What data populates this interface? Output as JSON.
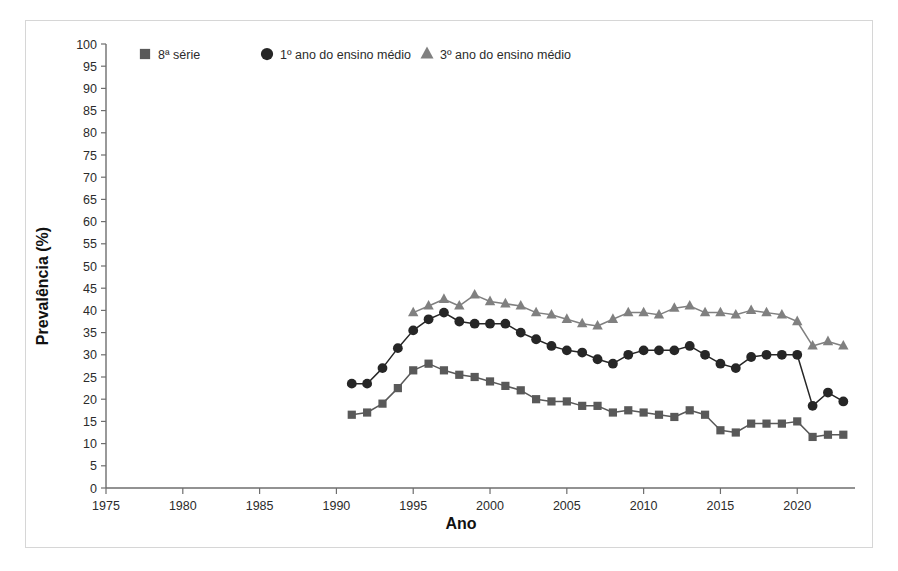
{
  "figure": {
    "background": "#ffffff",
    "border_color": "#d6d6d6"
  },
  "axis": {
    "ylabel": "Prevalência (%)",
    "xlabel": "Ano",
    "y_ticks": [
      "0",
      "5",
      "10",
      "15",
      "20",
      "25",
      "30",
      "35",
      "40",
      "45",
      "50",
      "55",
      "60",
      "65",
      "70",
      "75",
      "80",
      "85",
      "90",
      "95",
      "100"
    ],
    "x_ticks": [
      "1975",
      "1980",
      "1985",
      "1990",
      "1995",
      "2000",
      "2005",
      "2010",
      "2015",
      "2020"
    ]
  },
  "legend": {
    "items": [
      {
        "label": "8ª série",
        "marker": "square",
        "color": "#595959"
      },
      {
        "label": "1º ano do ensino médio",
        "marker": "circle",
        "color": "#262626"
      },
      {
        "label": "3º ano do ensino médio",
        "marker": "triangle",
        "color": "#808080"
      }
    ]
  },
  "chart_data": {
    "type": "line",
    "title": "",
    "xlabel": "Ano",
    "ylabel": "Prevalência (%)",
    "xlim": [
      1975,
      2023.5
    ],
    "ylim": [
      0,
      100
    ],
    "ytick_step": 5,
    "xtick_step": 5,
    "grid": false,
    "legend_position": "top-left",
    "series": [
      {
        "name": "8ª série",
        "marker": "square",
        "color": "#595959",
        "x": [
          1991,
          1992,
          1993,
          1994,
          1995,
          1996,
          1997,
          1998,
          1999,
          2000,
          2001,
          2002,
          2003,
          2004,
          2005,
          2006,
          2007,
          2008,
          2009,
          2010,
          2011,
          2012,
          2013,
          2014,
          2015,
          2016,
          2017,
          2018,
          2019,
          2020,
          2021,
          2022,
          2023
        ],
        "y": [
          16.5,
          17.0,
          19.0,
          22.5,
          26.5,
          28.0,
          26.5,
          25.5,
          25.0,
          24.0,
          23.0,
          22.0,
          20.0,
          19.5,
          19.5,
          18.5,
          18.5,
          17.0,
          17.5,
          17.0,
          16.5,
          16.0,
          17.5,
          16.5,
          13.0,
          12.5,
          14.5,
          14.5,
          14.5,
          15.0,
          11.5,
          12.0,
          12.0
        ]
      },
      {
        "name": "1º ano do ensino médio",
        "marker": "circle",
        "color": "#262626",
        "x": [
          1991,
          1992,
          1993,
          1994,
          1995,
          1996,
          1997,
          1998,
          1999,
          2000,
          2001,
          2002,
          2003,
          2004,
          2005,
          2006,
          2007,
          2008,
          2009,
          2010,
          2011,
          2012,
          2013,
          2014,
          2015,
          2016,
          2017,
          2018,
          2019,
          2020,
          2021,
          2022,
          2023
        ],
        "y": [
          23.5,
          23.5,
          27.0,
          31.5,
          35.5,
          38.0,
          39.5,
          37.5,
          37.0,
          37.0,
          37.0,
          35.0,
          33.5,
          32.0,
          31.0,
          30.5,
          29.0,
          28.0,
          30.0,
          31.0,
          31.0,
          31.0,
          32.0,
          30.0,
          28.0,
          27.0,
          29.5,
          30.0,
          30.0,
          30.0,
          18.5,
          21.5,
          19.5
        ]
      },
      {
        "name": "3º ano do ensino médio",
        "marker": "triangle",
        "color": "#808080",
        "x": [
          1995,
          1996,
          1997,
          1998,
          1999,
          2000,
          2001,
          2002,
          2003,
          2004,
          2005,
          2006,
          2007,
          2008,
          2009,
          2010,
          2011,
          2012,
          2013,
          2014,
          2015,
          2016,
          2017,
          2018,
          2019,
          2020,
          2021,
          2022,
          2023
        ],
        "y": [
          39.5,
          41.0,
          42.5,
          41.0,
          43.5,
          42.0,
          41.5,
          41.0,
          39.5,
          39.0,
          38.0,
          37.0,
          36.5,
          38.0,
          39.5,
          39.5,
          39.0,
          40.5,
          41.0,
          39.5,
          39.5,
          39.0,
          40.0,
          39.5,
          39.0,
          37.5,
          32.0,
          33.0,
          32.0
        ]
      }
    ]
  }
}
